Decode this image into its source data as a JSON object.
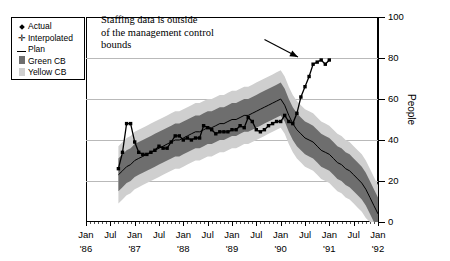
{
  "legend": {
    "items": [
      {
        "label": "Actual",
        "marker": "filled-diamond"
      },
      {
        "label": "Interpolated",
        "marker": "plus"
      },
      {
        "label": "Plan",
        "marker": "line"
      },
      {
        "label": "Green CB",
        "marker": "dark-swatch"
      },
      {
        "label": "Yellow CB",
        "marker": "light-swatch"
      }
    ]
  },
  "annotation": {
    "line1": "Staffing data is outside",
    "line2": "of the management control",
    "line3": "bounds"
  },
  "colors": {
    "green_cb": "#6e6e6e",
    "yellow_cb": "#cfcfcf",
    "actual": "#000000",
    "plan": "#000000",
    "grid": "#b9b9b9"
  },
  "chart_data": {
    "type": "line",
    "title": "",
    "xlabel": "",
    "ylabel": "People",
    "ylim": [
      0,
      100
    ],
    "yticks": [
      0,
      20,
      40,
      60,
      80,
      100
    ],
    "grid": true,
    "legend_position": "top-left",
    "xlim": [
      "Jan '86",
      "Jan '92"
    ],
    "xtick_labels": [
      {
        "month": "Jan",
        "year": "'86"
      },
      {
        "month": "Jul",
        "year": ""
      },
      {
        "month": "Jan",
        "year": "'87"
      },
      {
        "month": "Jul",
        "year": ""
      },
      {
        "month": "Jan",
        "year": "'88"
      },
      {
        "month": "Jul",
        "year": ""
      },
      {
        "month": "Jan",
        "year": "'89"
      },
      {
        "month": "Jul",
        "year": ""
      },
      {
        "month": "Jan",
        "year": "'90"
      },
      {
        "month": "Jul",
        "year": ""
      },
      {
        "month": "Jan",
        "year": "'91"
      },
      {
        "month": "Jul",
        "year": ""
      },
      {
        "month": "Jan",
        "year": "'92"
      }
    ],
    "x_months": [
      8,
      9,
      10,
      11,
      12,
      13,
      14,
      15,
      16,
      17,
      18,
      19,
      20,
      21,
      22,
      23,
      24,
      25,
      26,
      27,
      28,
      29,
      30,
      31,
      32,
      33,
      34,
      35,
      36,
      37,
      38,
      39,
      40,
      41,
      42,
      43,
      44,
      45,
      46,
      47,
      48,
      49,
      50,
      51,
      52,
      53,
      54,
      55,
      56,
      57,
      58,
      59,
      60,
      61,
      62,
      63,
      64,
      65,
      66,
      67,
      68,
      69,
      70,
      71,
      72
    ],
    "series": [
      {
        "name": "Actual",
        "values": [
          26,
          34,
          48,
          48,
          39,
          34,
          33,
          33,
          34,
          35,
          37,
          36,
          36,
          39,
          42,
          42,
          40,
          41,
          40,
          41,
          41,
          47,
          46,
          45,
          43,
          44,
          44,
          44,
          45,
          45,
          47,
          46,
          51,
          49,
          45,
          44,
          45,
          47,
          48,
          49,
          49,
          52,
          49,
          48,
          53,
          61,
          66,
          71,
          77,
          78,
          79,
          77,
          79
        ],
        "x_start_month": 8,
        "marker": "filled-diamond"
      },
      {
        "name": "Plan",
        "values": [
          23,
          25,
          27,
          28,
          30,
          31,
          32,
          33,
          34,
          35,
          36,
          37,
          38,
          39,
          40,
          40,
          41,
          42,
          43,
          44,
          44,
          45,
          46,
          46,
          47,
          48,
          48,
          49,
          50,
          50,
          51,
          52,
          52,
          53,
          54,
          55,
          56,
          57,
          58,
          59,
          60,
          57,
          52,
          48,
          45,
          43,
          41,
          40,
          39,
          37,
          35,
          34,
          33,
          31,
          29,
          28,
          26,
          25,
          23,
          21,
          19,
          16,
          12,
          8,
          4,
          2
        ],
        "x_start_month": 8,
        "marker": "none"
      },
      {
        "name": "Green CB upper",
        "values": [
          31,
          33,
          35,
          36,
          38,
          39,
          40,
          41,
          42,
          43,
          44,
          45,
          46,
          47,
          48,
          48,
          49,
          50,
          51,
          52,
          52,
          53,
          54,
          54,
          55,
          56,
          56,
          57,
          58,
          58,
          59,
          60,
          60,
          61,
          62,
          63,
          64,
          65,
          66,
          67,
          68,
          65,
          60,
          56,
          53,
          51,
          49,
          48,
          47,
          45,
          43,
          42,
          41,
          39,
          37,
          36,
          34,
          33,
          31,
          29,
          27,
          24,
          20,
          16,
          12,
          10
        ],
        "x_start_month": 8
      },
      {
        "name": "Green CB lower",
        "values": [
          15,
          17,
          19,
          20,
          22,
          23,
          24,
          25,
          26,
          27,
          28,
          29,
          30,
          31,
          32,
          32,
          33,
          34,
          35,
          36,
          36,
          37,
          38,
          38,
          39,
          40,
          40,
          41,
          42,
          42,
          43,
          44,
          44,
          45,
          46,
          47,
          48,
          49,
          50,
          51,
          52,
          49,
          44,
          40,
          37,
          35,
          33,
          32,
          31,
          29,
          27,
          26,
          25,
          23,
          21,
          20,
          18,
          17,
          15,
          13,
          11,
          8,
          4,
          0,
          0,
          0
        ],
        "x_start_month": 8
      },
      {
        "name": "Yellow CB upper",
        "values": [
          37,
          39,
          41,
          42,
          44,
          45,
          46,
          47,
          48,
          49,
          50,
          51,
          52,
          53,
          54,
          54,
          55,
          56,
          57,
          58,
          58,
          59,
          60,
          60,
          61,
          62,
          62,
          63,
          64,
          64,
          65,
          66,
          66,
          67,
          68,
          69,
          70,
          71,
          72,
          73,
          74,
          71,
          66,
          62,
          59,
          57,
          55,
          54,
          53,
          51,
          49,
          48,
          47,
          45,
          43,
          42,
          40,
          39,
          37,
          35,
          33,
          30,
          26,
          22,
          18,
          16
        ],
        "x_start_month": 8
      },
      {
        "name": "Yellow CB lower",
        "values": [
          9,
          11,
          13,
          14,
          16,
          17,
          18,
          19,
          20,
          21,
          22,
          23,
          24,
          25,
          26,
          26,
          27,
          28,
          29,
          30,
          30,
          31,
          32,
          32,
          33,
          34,
          34,
          35,
          36,
          36,
          37,
          38,
          38,
          39,
          40,
          41,
          42,
          43,
          44,
          45,
          46,
          43,
          38,
          34,
          31,
          29,
          27,
          26,
          25,
          23,
          21,
          20,
          19,
          17,
          15,
          14,
          12,
          11,
          9,
          7,
          5,
          2,
          0,
          0,
          0,
          0
        ],
        "x_start_month": 8
      }
    ],
    "annotations": [
      {
        "text": "Staffing data is outside of the management control bounds",
        "arrow_from": {
          "month": 44,
          "value": 89
        },
        "arrow_to": {
          "month": 53,
          "value": 79
        }
      }
    ]
  }
}
